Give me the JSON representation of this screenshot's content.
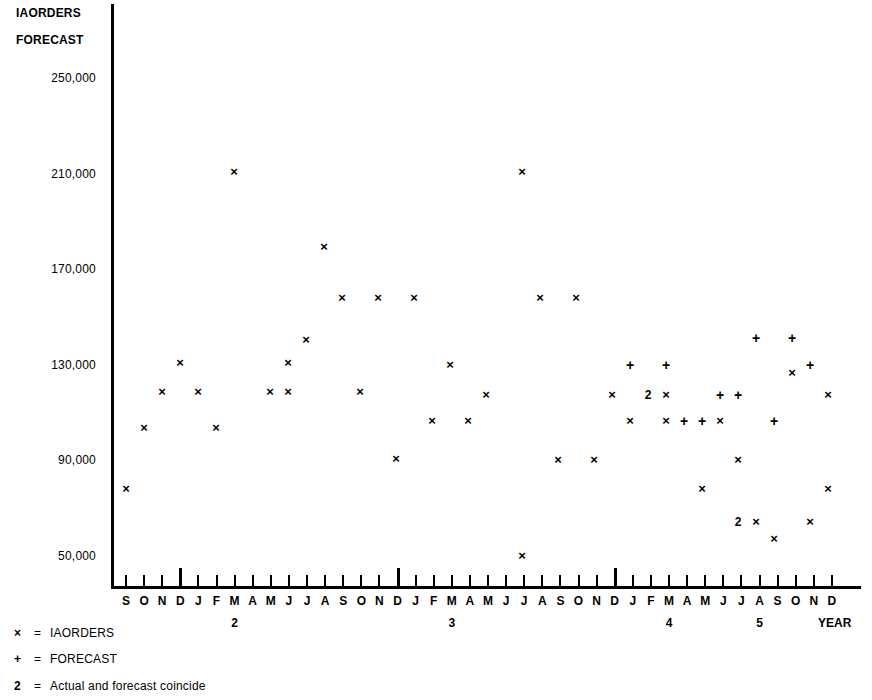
{
  "axis": {
    "y_title_line1": "IAORDERS",
    "y_title_line2": "FORECAST",
    "x_axis_caption": "YEAR"
  },
  "legend": {
    "items": [
      {
        "symbol": "×",
        "eq": "=",
        "label": "IAORDERS"
      },
      {
        "symbol": "+",
        "eq": "=",
        "label": "FORECAST"
      },
      {
        "symbol": "2",
        "eq": "=",
        "label": "Actual and forecast coincide"
      }
    ]
  },
  "chart_data": {
    "type": "scatter",
    "title": "IAORDERS FORECAST",
    "xlabel": "YEAR",
    "ylabel": "IAORDERS FORECAST",
    "grid": false,
    "legend_position": "below-left",
    "ylim": [
      30000,
      262000
    ],
    "ytick_labels": [
      "250,000",
      "210,000",
      "170,000",
      "130,000",
      "90,000",
      "50,000"
    ],
    "ytick_values": [
      250000,
      210000,
      170000,
      130000,
      90000,
      50000
    ],
    "xtick_labels": [
      "S",
      "O",
      "N",
      "D",
      "J",
      "F",
      "M",
      "A",
      "M",
      "J",
      "J",
      "A",
      "S",
      "O",
      "N",
      "D",
      "J",
      "F",
      "M",
      "A",
      "M",
      "J",
      "J",
      "A",
      "S",
      "O",
      "N",
      "D",
      "J",
      "F",
      "M",
      "A",
      "M",
      "J",
      "J",
      "A",
      "S",
      "O",
      "N",
      "D"
    ],
    "year_boundaries": [
      {
        "after_index": 3,
        "label": "2",
        "label_at_index": 6
      },
      {
        "after_index": 15,
        "label": "3",
        "label_at_index": 18
      },
      {
        "after_index": 27,
        "label": "4",
        "label_at_index": 30
      },
      {
        "after_index": 39,
        "label": "5",
        "label_at_index": 34
      }
    ],
    "year_label_positions": [
      {
        "index": 6,
        "label": "2"
      },
      {
        "index": 18,
        "label": "3"
      },
      {
        "index": 30,
        "label": "4"
      },
      {
        "index": 35,
        "label": "5"
      }
    ],
    "series": [
      {
        "name": "IAORDERS",
        "marker": "x",
        "points": [
          {
            "index": 0,
            "month": "S",
            "value": 80000
          },
          {
            "index": 1,
            "month": "O",
            "value": 105000
          },
          {
            "index": 2,
            "month": "N",
            "value": 130000
          },
          {
            "index": 3,
            "month": "D",
            "value": 120000
          },
          {
            "index": 4,
            "month": "J",
            "value": 105000
          },
          {
            "index": 6,
            "month": "M",
            "value": 210000
          },
          {
            "index": 8,
            "month": "M",
            "value": 120000
          },
          {
            "index": 9,
            "month": "J",
            "value": 120000
          },
          {
            "index": 10,
            "month": "J",
            "value": 130000
          },
          {
            "index": 11,
            "month": "A",
            "value": 140000
          },
          {
            "index": 12,
            "month": "S",
            "value": 178000
          },
          {
            "index": 13,
            "month": "O",
            "value": 160000
          },
          {
            "index": 14,
            "month": "N",
            "value": 120000
          },
          {
            "index": 15,
            "month": "D",
            "value": 160000
          },
          {
            "index": 16,
            "month": "J",
            "value": 90000
          },
          {
            "index": 17,
            "month": "F",
            "value": 160000
          },
          {
            "index": 19,
            "month": "A",
            "value": 105000
          },
          {
            "index": 20,
            "month": "M",
            "value": 130000
          },
          {
            "index": 21,
            "month": "J",
            "value": 105000
          },
          {
            "index": 22,
            "month": "J",
            "value": 120000
          },
          {
            "index": 23,
            "month": "A",
            "value": 210000
          },
          {
            "index": 24,
            "month": "S",
            "value": 90000
          },
          {
            "index": 25,
            "month": "O",
            "value": 160000
          },
          {
            "index": 26,
            "month": "N",
            "value": 160000
          },
          {
            "index": 27,
            "month": "D",
            "value": 90000
          },
          {
            "index": 28,
            "month": "J",
            "value": 50000
          },
          {
            "index": 29,
            "month": "F",
            "value": 118000
          },
          {
            "index": 30,
            "month": "M",
            "value": 105000
          },
          {
            "index": 32,
            "month": "M",
            "value": 105000
          },
          {
            "index": 33,
            "month": "J",
            "value": 105000
          },
          {
            "index": 34,
            "month": "J",
            "value": 105000
          },
          {
            "index": 35,
            "month": "A",
            "value": 90000
          },
          {
            "index": 36,
            "month": "S",
            "value": 80000
          },
          {
            "index": 37,
            "month": "O",
            "value": 65000
          },
          {
            "index": 38,
            "month": "N",
            "value": 58000
          },
          {
            "index": 39,
            "month": "D",
            "value": 128000
          },
          {
            "index": 31,
            "month": "A",
            "value": 65000
          },
          {
            "index": 38,
            "month": "N",
            "value": 65000
          },
          {
            "index": 39,
            "month": "D",
            "value": 80000
          }
        ]
      },
      {
        "name": "FORECAST",
        "marker": "+",
        "points": [
          {
            "index": 29,
            "month": "F",
            "value": 128000
          },
          {
            "index": 31,
            "month": "A",
            "value": 128000
          },
          {
            "index": 32,
            "month": "M",
            "value": 105000
          },
          {
            "index": 33,
            "month": "J",
            "value": 105000
          },
          {
            "index": 34,
            "month": "J",
            "value": 118000
          },
          {
            "index": 36,
            "month": "S",
            "value": 140000
          },
          {
            "index": 37,
            "month": "O",
            "value": 105000
          },
          {
            "index": 38,
            "month": "N",
            "value": 140000
          },
          {
            "index": 39,
            "month": "D",
            "value": 128000
          },
          {
            "index": 35,
            "month": "A",
            "value": 118000
          }
        ]
      },
      {
        "name": "COINCIDE",
        "marker": "2",
        "points": [
          {
            "index": 30,
            "month": "M",
            "value": 113000
          },
          {
            "index": 36,
            "month": "S",
            "value": 65000
          }
        ]
      }
    ],
    "markers": [
      {
        "type": "x",
        "mx": 126,
        "my": 490
      },
      {
        "type": "x",
        "mx": 144,
        "my": 429
      },
      {
        "type": "x",
        "mx": 180,
        "my": 364
      },
      {
        "type": "x",
        "mx": 162,
        "my": 393
      },
      {
        "type": "x",
        "mx": 198,
        "my": 393
      },
      {
        "type": "x",
        "mx": 216,
        "my": 429
      },
      {
        "type": "x",
        "mx": 234,
        "my": 173
      },
      {
        "type": "x",
        "mx": 270,
        "my": 393
      },
      {
        "type": "x",
        "mx": 288,
        "my": 393
      },
      {
        "type": "x",
        "mx": 288,
        "my": 364
      },
      {
        "type": "x",
        "mx": 306,
        "my": 341
      },
      {
        "type": "x",
        "mx": 324,
        "my": 248
      },
      {
        "type": "x",
        "mx": 342,
        "my": 299
      },
      {
        "type": "x",
        "mx": 360,
        "my": 393
      },
      {
        "type": "x",
        "mx": 378,
        "my": 299
      },
      {
        "type": "x",
        "mx": 396,
        "my": 460
      },
      {
        "type": "x",
        "mx": 414,
        "my": 299
      },
      {
        "type": "x",
        "mx": 432,
        "my": 422
      },
      {
        "type": "x",
        "mx": 450,
        "my": 366
      },
      {
        "type": "x",
        "mx": 468,
        "my": 422
      },
      {
        "type": "x",
        "mx": 486,
        "my": 396
      },
      {
        "type": "x",
        "mx": 522,
        "my": 173
      },
      {
        "type": "x",
        "mx": 522,
        "my": 557
      },
      {
        "type": "x",
        "mx": 540,
        "my": 299
      },
      {
        "type": "x",
        "mx": 558,
        "my": 461
      },
      {
        "type": "x",
        "mx": 576,
        "my": 299
      },
      {
        "type": "x",
        "mx": 594,
        "my": 461
      },
      {
        "type": "x",
        "mx": 612,
        "my": 396
      },
      {
        "type": "x",
        "mx": 630,
        "my": 422
      },
      {
        "type": "x",
        "mx": 666,
        "my": 422
      },
      {
        "type": "x",
        "mx": 666,
        "my": 396
      },
      {
        "type": "x",
        "mx": 702,
        "my": 490
      },
      {
        "type": "x",
        "mx": 720,
        "my": 422
      },
      {
        "type": "x",
        "mx": 738,
        "my": 461
      },
      {
        "type": "x",
        "mx": 756,
        "my": 523
      },
      {
        "type": "x",
        "mx": 774,
        "my": 540
      },
      {
        "type": "x",
        "mx": 792,
        "my": 374
      },
      {
        "type": "x",
        "mx": 810,
        "my": 523
      },
      {
        "type": "x",
        "mx": 828,
        "my": 490
      },
      {
        "type": "x",
        "mx": 828,
        "my": 396
      },
      {
        "type": "+",
        "mx": 630,
        "my": 366
      },
      {
        "type": "+",
        "mx": 666,
        "my": 366
      },
      {
        "type": "+",
        "mx": 684,
        "my": 422
      },
      {
        "type": "+",
        "mx": 702,
        "my": 422
      },
      {
        "type": "+",
        "mx": 720,
        "my": 396
      },
      {
        "type": "+",
        "mx": 756,
        "my": 339
      },
      {
        "type": "+",
        "mx": 774,
        "my": 422
      },
      {
        "type": "+",
        "mx": 792,
        "my": 339
      },
      {
        "type": "+",
        "mx": 810,
        "my": 366
      },
      {
        "type": "+",
        "mx": 738,
        "my": 396
      },
      {
        "type": "2",
        "mx": 648,
        "my": 396
      },
      {
        "type": "2",
        "mx": 738,
        "my": 523
      }
    ]
  }
}
